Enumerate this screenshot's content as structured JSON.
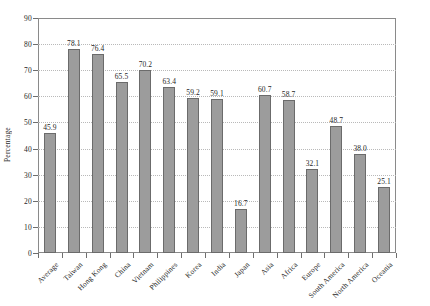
{
  "chart_data": {
    "type": "bar",
    "title": "",
    "subtitle": "",
    "xlabel": "",
    "ylabel": "Percentage",
    "ylim": [
      0,
      90
    ],
    "ytick_step": 10,
    "yticks": [
      0,
      10,
      20,
      30,
      40,
      50,
      60,
      70,
      80,
      90
    ],
    "grid": "horizontal-dotted",
    "legend": "none",
    "bar_color": "#9c9c9c",
    "bar_edge_color": "#6b6b6b",
    "categories": [
      "Average",
      "Taiwan",
      "Hong Kong",
      "China",
      "Vietnam",
      "Philippines",
      "Korea",
      "India",
      "Japan",
      "Asia",
      "Africa",
      "Europe",
      "South America",
      "North America",
      "Oceania"
    ],
    "values": [
      45.9,
      78.1,
      76.4,
      65.5,
      70.2,
      63.4,
      59.2,
      59.1,
      16.7,
      60.7,
      58.7,
      32.1,
      48.7,
      38.0,
      25.1
    ],
    "data_labels": [
      "45.9",
      "78.1",
      "76.4",
      "65.5",
      "70.2",
      "63.4",
      "59.2",
      "59.1",
      "16.7",
      "60.7",
      "58.7",
      "32.1",
      "48.7",
      "38.0",
      "25.1"
    ],
    "ytick_labels": [
      "0",
      "10",
      "20",
      "30",
      "40",
      "50",
      "60",
      "70",
      "80",
      "90"
    ]
  }
}
